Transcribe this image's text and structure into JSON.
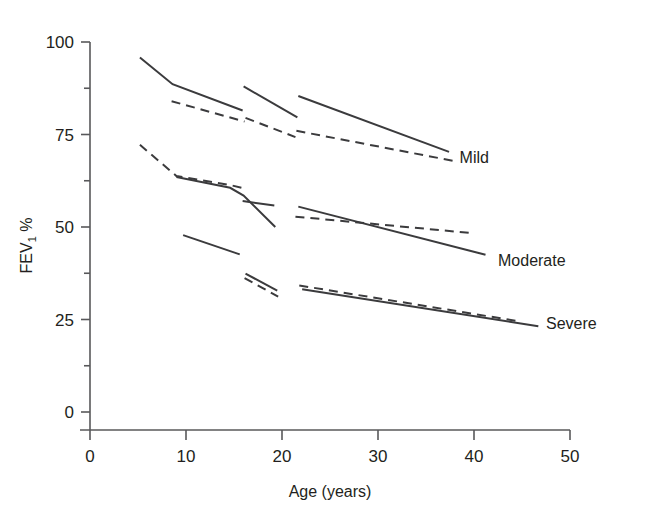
{
  "chart_data": {
    "type": "line",
    "title": "",
    "xlabel": "Age (years)",
    "ylabel": "FEV1 %",
    "ylabel_main": "FEV",
    "ylabel_sub": "1",
    "ylabel_unit": "%",
    "xlim": [
      0,
      50
    ],
    "ylim": [
      0,
      100
    ],
    "xticks": [
      0,
      10,
      20,
      30,
      40,
      50
    ],
    "yticks": [
      0,
      25,
      50,
      75,
      100
    ],
    "xtick_labels": [
      "0",
      "10",
      "20",
      "30",
      "40",
      "50"
    ],
    "ytick_labels": [
      "0",
      "25",
      "50",
      "75",
      "100"
    ],
    "y_minor_ticks": [
      12.5,
      37.5,
      62.5,
      87.5
    ],
    "grid": false,
    "legend_position": "right-inline",
    "line_color": "#3b3b3d",
    "axis_color": "#58585a",
    "annotations": [
      {
        "name": "mild-label",
        "text": "Mild",
        "x": 38.5,
        "y": 69
      },
      {
        "name": "moderate-label",
        "text": "Moderate",
        "x": 42.5,
        "y": 41
      },
      {
        "name": "severe-label",
        "text": "Severe",
        "x": 47.5,
        "y": 24
      }
    ],
    "series": [
      {
        "name": "Mild - observed (solid)",
        "style": "solid",
        "group": "Mild",
        "segments": [
          {
            "points": [
              [
                5.2,
                95.8
              ],
              [
                8.6,
                88.6
              ],
              [
                15.9,
                81.5
              ]
            ]
          },
          {
            "points": [
              [
                16.0,
                88.0
              ],
              [
                21.6,
                79.6
              ]
            ]
          },
          {
            "points": [
              [
                21.7,
                85.4
              ],
              [
                37.4,
                70.3
              ]
            ]
          }
        ]
      },
      {
        "name": "Mild - predicted (dashed)",
        "style": "dashed",
        "group": "Mild",
        "segments": [
          {
            "points": [
              [
                8.5,
                84.0
              ],
              [
                16.1,
                78.5
              ]
            ]
          },
          {
            "points": [
              [
                16.2,
                79.5
              ],
              [
                21.4,
                74.3
              ]
            ]
          },
          {
            "points": [
              [
                21.5,
                76.0
              ],
              [
                38.0,
                67.8
              ]
            ]
          }
        ]
      },
      {
        "name": "Moderate - observed (solid)",
        "style": "solid",
        "group": "Moderate",
        "segments": [
          {
            "points": [
              [
                9.0,
                63.5
              ],
              [
                14.6,
                60.6
              ],
              [
                16.0,
                58.5
              ],
              [
                19.3,
                50.0
              ]
            ]
          },
          {
            "points": [
              [
                15.9,
                57.0
              ],
              [
                19.2,
                55.8
              ]
            ]
          },
          {
            "points": [
              [
                21.7,
                55.5
              ],
              [
                41.2,
                42.5
              ]
            ]
          }
        ]
      },
      {
        "name": "Moderate - predicted (dashed)",
        "style": "dashed",
        "group": "Moderate",
        "segments": [
          {
            "points": [
              [
                5.2,
                72.2
              ],
              [
                9.0,
                63.8
              ],
              [
                14.5,
                61.4
              ],
              [
                16.1,
                60.4
              ]
            ]
          },
          {
            "points": [
              [
                21.4,
                52.8
              ],
              [
                39.6,
                48.4
              ]
            ]
          }
        ]
      },
      {
        "name": "Severe - observed (solid)",
        "style": "solid",
        "group": "Severe",
        "segments": [
          {
            "points": [
              [
                9.7,
                47.8
              ],
              [
                15.6,
                42.6
              ]
            ]
          },
          {
            "points": [
              [
                16.2,
                37.4
              ],
              [
                19.5,
                32.8
              ]
            ]
          },
          {
            "points": [
              [
                22.1,
                33.2
              ],
              [
                46.7,
                23.2
              ]
            ]
          }
        ]
      },
      {
        "name": "Severe - predicted (dashed)",
        "style": "dashed",
        "group": "Severe",
        "segments": [
          {
            "points": [
              [
                16.1,
                36.2
              ],
              [
                19.6,
                31.2
              ]
            ]
          },
          {
            "points": [
              [
                21.8,
                34.2
              ],
              [
                44.5,
                24.6
              ]
            ]
          }
        ]
      }
    ]
  }
}
